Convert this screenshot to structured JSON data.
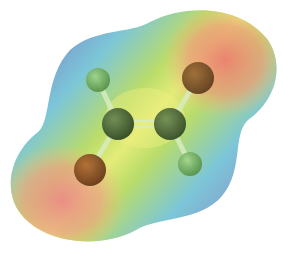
{
  "figure": {
    "molecule": "1,2-dichloroethylene",
    "colors": {
      "negative": "#e8877a",
      "neutral": "#b9dc6a",
      "center": "#e6ee7a",
      "positive": "#7c8fc8",
      "cyan": "#7cc6d8",
      "carbon": "#3f5a2e",
      "chlorine": "#8a4a1e",
      "hydrogen": "#6fb25a"
    },
    "atoms": [
      {
        "element": "H",
        "x": 98,
        "y": 80,
        "r": 12
      },
      {
        "element": "Cl",
        "x": 198,
        "y": 78,
        "r": 16
      },
      {
        "element": "C",
        "x": 118,
        "y": 124,
        "r": 16
      },
      {
        "element": "C",
        "x": 170,
        "y": 124,
        "r": 16
      },
      {
        "element": "Cl",
        "x": 90,
        "y": 170,
        "r": 16
      },
      {
        "element": "H",
        "x": 190,
        "y": 164,
        "r": 12
      }
    ]
  }
}
